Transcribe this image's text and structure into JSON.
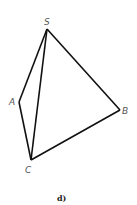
{
  "figure": {
    "caption": "d)",
    "stroke_color": "#111111",
    "vertices": {
      "S": {
        "label": "S",
        "x": 47,
        "y": 29,
        "lx": 45,
        "ly": 24
      },
      "A": {
        "label": "A",
        "x": 19,
        "y": 102,
        "lx": 9,
        "ly": 105
      },
      "B": {
        "label": "B",
        "x": 120,
        "y": 110,
        "lx": 122,
        "ly": 114
      },
      "C": {
        "label": "C",
        "x": 31,
        "y": 160,
        "lx": 25,
        "ly": 172
      }
    },
    "edges": [
      [
        "S",
        "A"
      ],
      [
        "S",
        "B"
      ],
      [
        "S",
        "C"
      ],
      [
        "A",
        "C"
      ],
      [
        "C",
        "B"
      ]
    ]
  }
}
